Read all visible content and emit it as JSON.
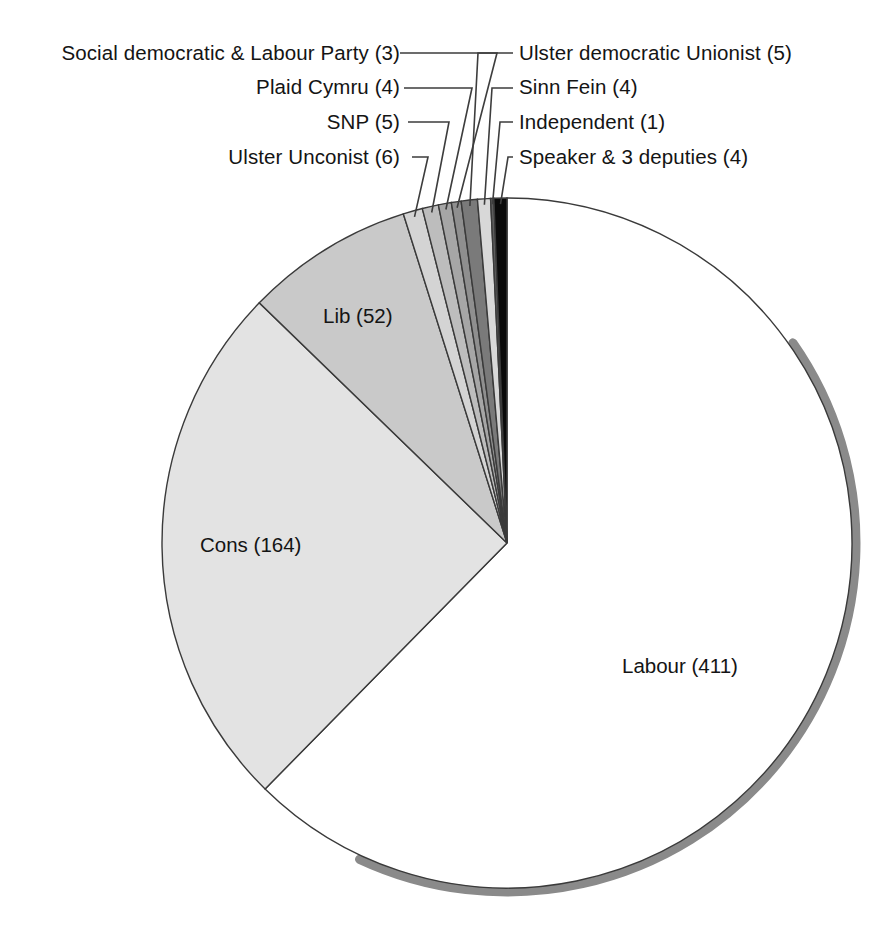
{
  "chart_data": {
    "type": "pie",
    "title": "",
    "subtitle": "",
    "xlabel": "",
    "ylabel": "",
    "total": 656,
    "start_angle_deg": 0,
    "direction": "clockwise",
    "legend_position": "callout-labels",
    "grid": false,
    "categories": [
      "Labour",
      "Cons",
      "Lib",
      "Ulster Unconist",
      "SNP",
      "Plaid Cymru",
      "Social democratic & Labour Party",
      "Ulster democratic Unionist",
      "Sinn Fein",
      "Independent",
      "Speaker & 3 deputies"
    ],
    "values": [
      411,
      164,
      52,
      6,
      5,
      4,
      3,
      5,
      4,
      1,
      4
    ],
    "labels": [
      "Labour (411)",
      "Cons (164)",
      "Lib (52)",
      "Ulster Unconist (6)",
      "SNP (5)",
      "Plaid Cymru (4)",
      "Social democratic & Labour Party (3)",
      "Ulster democratic Unionist (5)",
      "Sinn Fein (4)",
      "Independent (1)",
      "Speaker & 3 deputies (4)"
    ],
    "colors": [
      "#ffffff",
      "#e3e3e3",
      "#c9c9c9",
      "#d4d4d4",
      "#bdbdbd",
      "#a6a6a6",
      "#8f8f8f",
      "#7a7a7a",
      "#d8d8d8",
      "#5c5c5c",
      "#0a0a0a"
    ],
    "edge_color": "#3a3a3a",
    "shadow_color": "#8a8a8a"
  },
  "slice_labels": {
    "labour": "Labour (411)",
    "cons": "Cons (164)",
    "lib": "Lib (52)"
  },
  "callouts_left": [
    {
      "text": "Social democratic & Labour Party (3)"
    },
    {
      "text": "Plaid Cymru (4)"
    },
    {
      "text": "SNP (5)"
    },
    {
      "text": "Ulster Unconist (6)"
    }
  ],
  "callouts_right": [
    {
      "text": "Ulster democratic Unionist (5)"
    },
    {
      "text": "Sinn Fein (4)"
    },
    {
      "text": "Independent (1)"
    },
    {
      "text": "Speaker & 3 deputies (4)"
    }
  ]
}
